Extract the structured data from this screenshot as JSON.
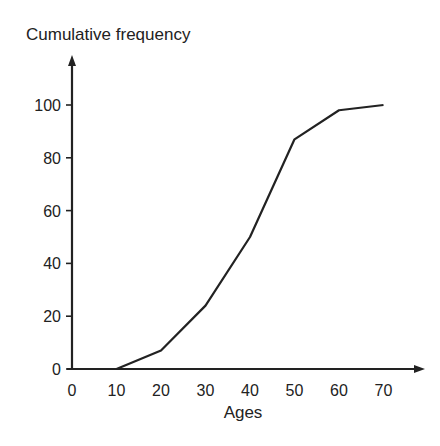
{
  "chart_data": {
    "type": "line",
    "title": "",
    "xlabel": "Ages",
    "ylabel": "Cumulative frequency",
    "x": [
      10,
      20,
      30,
      40,
      50,
      60,
      70
    ],
    "series": [
      {
        "name": "Cumulative frequency",
        "values": [
          0,
          7,
          24,
          50,
          87,
          98,
          100
        ]
      }
    ],
    "xticks": [
      0,
      10,
      20,
      30,
      40,
      50,
      60,
      70
    ],
    "yticks": [
      0,
      20,
      40,
      60,
      80,
      100
    ],
    "xlim": [
      0,
      78
    ],
    "ylim": [
      0,
      118
    ],
    "grid": false,
    "legend": "none",
    "line_color": "#222222"
  }
}
